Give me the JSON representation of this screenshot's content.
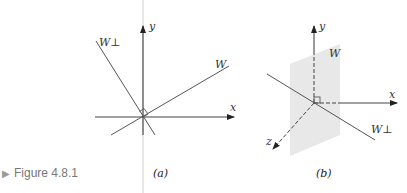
{
  "figure": {
    "caption_marker": "▶",
    "caption_label": "Figure 4.8.1"
  },
  "panel_a": {
    "label": "(a)",
    "axis_x_label": "x",
    "axis_y_label": "y",
    "subspace_label": "W",
    "complement_label": "W⊥"
  },
  "panel_b": {
    "label": "(b)",
    "axis_x_label": "x",
    "axis_y_label": "y",
    "axis_z_label": "z",
    "subspace_label": "W",
    "complement_label": "W⊥"
  },
  "colors": {
    "line": "#555555",
    "axis": "#333333",
    "divider": "#c8c8c8",
    "plane": "#e6e6e6",
    "caption": "#777777"
  }
}
